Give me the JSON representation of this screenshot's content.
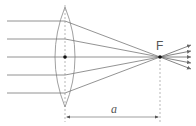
{
  "diagram": {
    "focus_label": "F",
    "distance_label": "a",
    "ray_count": 5,
    "colors": {
      "ray": "#777777",
      "lens": "#888888",
      "axis": "#999999",
      "point": "#111111"
    }
  }
}
